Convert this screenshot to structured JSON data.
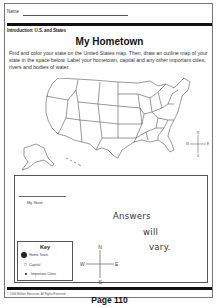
{
  "header": {
    "name_label": "Name"
  },
  "worksheet": {
    "subtitle": "Introduction: U.S. and States",
    "title": "My Hometown",
    "instructions": "Find and color your state on the United States map. Then, draw an outline map of your state in the space below. Label your hometown, capital and any other important cities, rivers and bodies of water.",
    "map_compass": {
      "n": "N",
      "s": "S",
      "e": "E",
      "w": "W"
    }
  },
  "state_box": {
    "label": "My State",
    "answer_lines": [
      "Answers",
      "will",
      "vary."
    ],
    "key": {
      "title": "Key",
      "items": [
        {
          "icon": "filled-circle-icon",
          "label": "Home Town"
        },
        {
          "icon": "star-icon",
          "label": "Capital"
        },
        {
          "icon": "small-dot-icon",
          "label": "Important Cities"
        }
      ]
    },
    "compass": {
      "n": "N",
      "s": "S",
      "e": "E",
      "w": "W"
    }
  },
  "footer": {
    "copyright": "© 2006 Milliken Education. All Rights Reserved.",
    "page_label": "Page 110"
  },
  "colors": {
    "ink": "#111111",
    "border": "#555555",
    "paper": "#ffffff"
  }
}
